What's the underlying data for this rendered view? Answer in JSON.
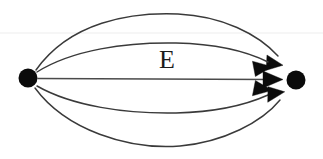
{
  "diagram": {
    "type": "directed-multigraph",
    "title": "",
    "canvas": {
      "width": 323,
      "height": 159,
      "background": "#ffffff"
    },
    "ink_color": "#0a0a0a",
    "edge_color": "#3a3a3a",
    "label": {
      "text": "E",
      "role": "edge-set-label",
      "x": 167,
      "y": 62,
      "font_size": 26
    },
    "vertices": [
      {
        "id": "v-left",
        "name": "left-vertex",
        "label": "",
        "cx": 28,
        "cy": 78,
        "r": 9.5,
        "fill": "#0a0a0a"
      },
      {
        "id": "v-right",
        "name": "right-vertex",
        "label": "",
        "cx": 296,
        "cy": 80,
        "r": 9.5,
        "fill": "#0a0a0a"
      }
    ],
    "edge_count": 5,
    "edges": [
      {
        "id": "e1",
        "name": "edge-top-outer",
        "from": "v-left",
        "to": "v-right",
        "directed": true,
        "curve": "arc-up-large",
        "apex_y": 15,
        "arrow_angle_deg": 52
      },
      {
        "id": "e2",
        "name": "edge-top-inner",
        "from": "v-left",
        "to": "v-right",
        "directed": true,
        "curve": "arc-up-small",
        "apex_y": 44,
        "arrow_angle_deg": 26
      },
      {
        "id": "e3",
        "name": "edge-straight",
        "from": "v-left",
        "to": "v-right",
        "directed": true,
        "curve": "straight",
        "apex_y": 79,
        "arrow_angle_deg": 0
      },
      {
        "id": "e4",
        "name": "edge-bottom-inner",
        "from": "v-left",
        "to": "v-right",
        "directed": true,
        "curve": "arc-down-small",
        "apex_y": 113,
        "arrow_angle_deg": -28
      },
      {
        "id": "e5",
        "name": "edge-bottom-outer",
        "from": "v-left",
        "to": "v-right",
        "directed": true,
        "curve": "arc-down-large",
        "apex_y": 145,
        "arrow_angle_deg": -58
      }
    ],
    "artifact": {
      "name": "scan-horizontal-line",
      "visible": true,
      "y": 33,
      "color": "#ededed"
    }
  }
}
